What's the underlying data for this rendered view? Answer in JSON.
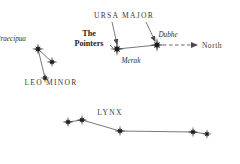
{
  "figure": {
    "kind": "star-chart",
    "background_color": "#ffffff",
    "ink_color": "#1d1d1d",
    "line_color": "#555555",
    "width": 240,
    "height": 164
  },
  "labels": {
    "ursa_major": "URSA MAJOR",
    "the_pointers_line1": "The",
    "the_pointers_line2": "Pointers",
    "dubhe": "Dubhe",
    "merak": "Merak",
    "north": "North",
    "praecipua": "Praecipua",
    "leo_minor": "LEO MINOR",
    "lynx": "LYNX"
  },
  "chart_data": {
    "type": "scatter",
    "title": "",
    "xlabel": "",
    "ylabel": "",
    "xlim": [
      0,
      240
    ],
    "ylim": [
      0,
      164
    ],
    "grid": false,
    "legend": "none",
    "constellations": [
      {
        "name": "URSA MAJOR",
        "label_position": [
          124,
          16
        ],
        "stars": [
          {
            "name": "Merak",
            "x": 117,
            "y": 49,
            "magnitude_size": 11,
            "label_position": [
              131,
              62
            ],
            "label_style": "italic"
          },
          {
            "name": "Dubhe",
            "x": 157,
            "y": 45,
            "magnitude_size": 11,
            "label_position": [
              168,
              36
            ],
            "label_style": "italic"
          }
        ],
        "links": [
          [
            0,
            1
          ]
        ],
        "leader_lines": [
          {
            "from": [
              112,
              22
            ],
            "to": [
              117,
              44
            ]
          },
          {
            "from": [
              146,
              22
            ],
            "to": [
              155,
              41
            ]
          }
        ]
      },
      {
        "name": "LEO MINOR",
        "label_position": [
          51,
          83
        ],
        "stars": [
          {
            "name": "Praecipua",
            "x": 38,
            "y": 49,
            "magnitude_size": 9,
            "label_position": [
              11,
              40
            ],
            "label_style": "italic"
          },
          {
            "name": "",
            "x": 52,
            "y": 62,
            "magnitude_size": 8,
            "label_position": null,
            "label_style": null
          },
          {
            "name": "",
            "x": 45,
            "y": 78,
            "magnitude_size": 7,
            "label_position": null,
            "label_style": null
          }
        ],
        "links": [
          [
            0,
            1
          ],
          [
            0,
            2
          ]
        ],
        "leader_lines": []
      },
      {
        "name": "LYNX",
        "label_position": [
          110,
          113
        ],
        "stars": [
          {
            "name": "",
            "x": 68,
            "y": 122,
            "magnitude_size": 8,
            "label_position": null,
            "label_style": null
          },
          {
            "name": "",
            "x": 82,
            "y": 120,
            "magnitude_size": 8,
            "label_position": null,
            "label_style": null
          },
          {
            "name": "",
            "x": 120,
            "y": 131,
            "magnitude_size": 8,
            "label_position": null,
            "label_style": null
          },
          {
            "name": "",
            "x": 193,
            "y": 132,
            "magnitude_size": 8,
            "label_position": null,
            "label_style": null
          },
          {
            "name": "",
            "x": 207,
            "y": 134,
            "magnitude_size": 7,
            "label_position": null,
            "label_style": null
          }
        ],
        "links": [
          [
            0,
            1
          ],
          [
            1,
            2
          ],
          [
            2,
            3
          ],
          [
            3,
            4
          ]
        ],
        "leader_lines": []
      }
    ],
    "annotations": [
      {
        "text": "The Pointers",
        "type": "feature-label",
        "position": [
          89,
          39
        ],
        "pointer_line": {
          "from": [
            110,
            45
          ],
          "to": [
            113,
            48
          ]
        }
      },
      {
        "text": "North",
        "type": "direction-arrow",
        "position": [
          212,
          46
        ],
        "arrow": {
          "from": [
            163,
            45
          ],
          "to": [
            197,
            45
          ],
          "style": "dashed"
        }
      }
    ]
  }
}
